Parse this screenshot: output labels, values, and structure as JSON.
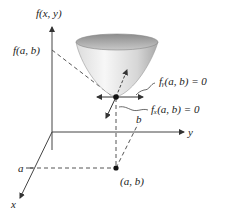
{
  "diagram": {
    "axes": {
      "vertical_label": "f(x, y)",
      "y_label": "y",
      "x_label": "x"
    },
    "labels": {
      "f_value": "f(a, b)",
      "fy_condition": "fᵧ(a, b) = 0",
      "fx_condition": "fₓ(a, b) = 0",
      "a_tick": "a",
      "b_tick": "b",
      "point": "(a, b)"
    },
    "colors": {
      "line": "#333333",
      "surface_light": "#f2f2f2",
      "surface_dark": "#b8b8b8",
      "rim": "#9a9a9a"
    }
  }
}
